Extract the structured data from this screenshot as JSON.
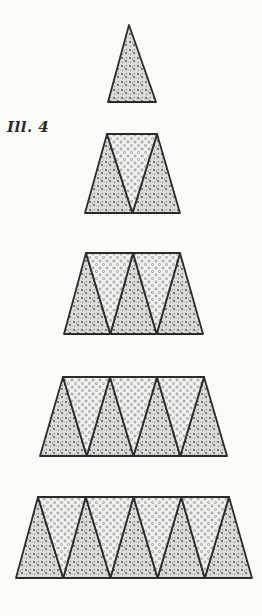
{
  "figure": {
    "label": "Ill. 4",
    "colors": {
      "background": "#fbfbf8",
      "outline": "#2b2b2b",
      "floral_fill": "#d9d9d4",
      "floral_mark": "#555555",
      "dot_fill": "#f2f2ee",
      "dot_mark": "#777777"
    },
    "rows": [
      {
        "count": 1,
        "top_y": 25,
        "bottom_y": 102,
        "top_left": 129,
        "top_right": 129,
        "bottom_left": 108,
        "bottom_right": 156
      },
      {
        "count": 3,
        "top_y": 134,
        "bottom_y": 213,
        "top_left": 107,
        "top_right": 157,
        "bottom_left": 85,
        "bottom_right": 180
      },
      {
        "count": 5,
        "top_y": 253,
        "bottom_y": 334,
        "top_left": 86,
        "top_right": 180,
        "bottom_left": 64,
        "bottom_right": 203
      },
      {
        "count": 7,
        "top_y": 377,
        "bottom_y": 456,
        "top_left": 63,
        "top_right": 204,
        "bottom_left": 40,
        "bottom_right": 227
      },
      {
        "count": 9,
        "top_y": 497,
        "bottom_y": 578,
        "top_left": 38,
        "top_right": 229,
        "bottom_left": 16,
        "bottom_right": 252
      }
    ],
    "patterns": {
      "up_triangle": "floral",
      "down_triangle": "dots"
    }
  }
}
